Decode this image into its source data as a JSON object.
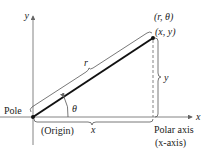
{
  "diagram": {
    "labels": {
      "y_axis": "y",
      "x_axis": "x",
      "polar_point": "(r, θ)",
      "rect_point": "(x, y)",
      "radius": "r",
      "height": "y",
      "angle": "θ",
      "pole": "Pole",
      "origin": "(Origin)",
      "base": "x",
      "polar_axis": "Polar axis",
      "polar_axis_sub": "(x-axis)"
    },
    "colors": {
      "line": "#111111",
      "axis": "#555555",
      "text": "#222222"
    }
  }
}
